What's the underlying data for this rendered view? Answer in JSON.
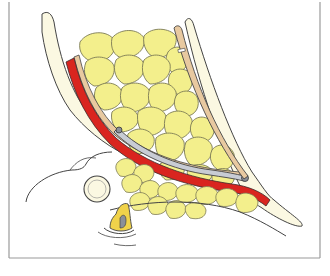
{
  "figure": {
    "kind": "anatomical-illustration",
    "caption": "",
    "colors": {
      "background": "#ffffff",
      "frame": "#9a9a9a",
      "fat_fill": "#f3ef8c",
      "fat_outline": "#7c7a55",
      "muscle_red": "#d9251f",
      "fascia_tan": "#e8c9a0",
      "bone_fill": "#fbf8e2",
      "outline": "#444444",
      "instrument_gray": "#c8ccd4",
      "joint_gray": "#8a8f99"
    }
  }
}
